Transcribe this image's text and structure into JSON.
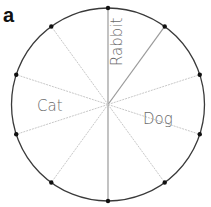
{
  "panel_label": "a",
  "circle": {
    "cx": 108,
    "cy": 104.5,
    "r": 96.5,
    "stroke": "#3a3a3a"
  },
  "spokes": {
    "count": 10,
    "start_angle_deg": 0,
    "step_deg": 36,
    "color": "#c8c8c8",
    "emphasis_color": "#9a9a9a"
  },
  "labels": {
    "rabbit": "Rabbit",
    "cat": "Cat",
    "dog": "Dog"
  }
}
